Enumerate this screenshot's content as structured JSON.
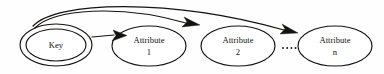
{
  "diagram": {
    "kind": "entity-relationship-functional-dependency",
    "background_color": "#fefefe",
    "ink_color": "#15130f",
    "width": 384,
    "height": 74,
    "nodes": [
      {
        "id": "key",
        "label": "Key",
        "sublabel": "",
        "shape": "double-ellipse",
        "cx": 56,
        "cy": 45,
        "rx": 36,
        "ry": 21,
        "inner_rx": 30,
        "inner_ry": 16
      },
      {
        "id": "attribute-1",
        "label": "Attribute",
        "sublabel": "1",
        "shape": "ellipse",
        "cx": 149,
        "cy": 46,
        "rx": 37,
        "ry": 20,
        "inner_rx": 0,
        "inner_ry": 0
      },
      {
        "id": "attribute-2",
        "label": "Attribute",
        "sublabel": "2",
        "shape": "ellipse",
        "cx": 238,
        "cy": 46,
        "rx": 37,
        "ry": 20,
        "inner_rx": 0,
        "inner_ry": 0
      },
      {
        "id": "attribute-n",
        "label": "Attribute",
        "sublabel": "n",
        "shape": "ellipse",
        "cx": 335,
        "cy": 46,
        "rx": 37,
        "ry": 20,
        "inner_rx": 0,
        "inner_ry": 0
      }
    ],
    "ellipsis": {
      "label": "....",
      "dot_count": 4,
      "x_start": 283,
      "y": 48,
      "spacing": 4.2,
      "radius": 0.95
    },
    "edges": [
      {
        "id": "key-to-attribute-1",
        "from": "key",
        "to": "attribute-1",
        "style": "straight",
        "path": "M 92 37 L 114 35"
      },
      {
        "id": "key-to-attribute-2",
        "from": "key",
        "to": "attribute-2",
        "style": "curved-arc",
        "path": "M 35 28 C 52 9 120 4 186 23"
      },
      {
        "id": "key-to-attribute-n",
        "from": "key",
        "to": "attribute-n",
        "style": "curved-arc",
        "path": "M 33 26 C 56 1 170 -2 284 30"
      }
    ],
    "arrowheads": [
      {
        "id": "arrowhead-attribute-1",
        "for_edge": "key-to-attribute-1",
        "points": "113,30 127,35.5 112,41 116,35.5"
      },
      {
        "id": "arrowhead-attribute-2",
        "for_edge": "key-to-attribute-2",
        "points": "184,17 200,25 182,27 187,22"
      },
      {
        "id": "arrowhead-attribute-n",
        "for_edge": "key-to-attribute-n",
        "points": "282,24 298,33 280,34 285,29"
      }
    ]
  }
}
